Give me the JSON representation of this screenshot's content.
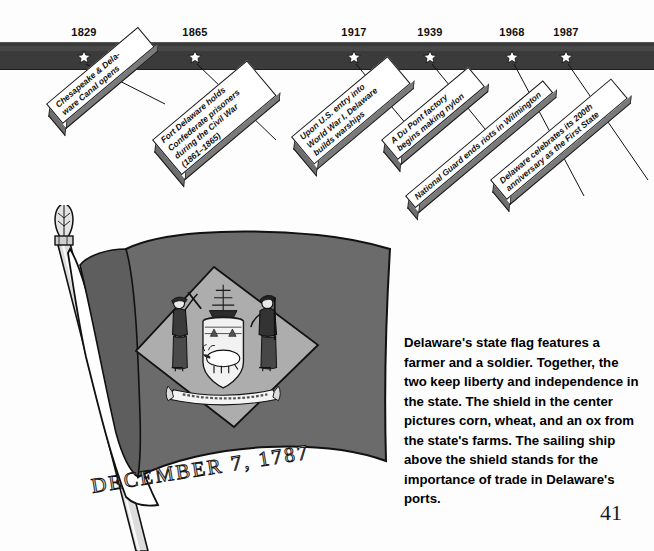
{
  "page": {
    "number": "41",
    "background_color": "#fdfdfd"
  },
  "timeline": {
    "bar_color": "#3b3b3b",
    "star_color": "#ffffff",
    "events": [
      {
        "year": "1829",
        "star_x": 84,
        "label_lines": [
          "Chesapeake & Dela-",
          "ware Canal opens"
        ],
        "plaque_x": 46,
        "plaque_y": 104,
        "plaque_w": 120,
        "plaque_h": 26
      },
      {
        "year": "1865",
        "star_x": 195,
        "label_lines": [
          "Fort Delaware holds",
          "Confederate prisoners",
          "during the Civil War",
          "(1861–1865)"
        ],
        "plaque_x": 152,
        "plaque_y": 140,
        "plaque_w": 124,
        "plaque_h": 46
      },
      {
        "year": "1917",
        "star_x": 354,
        "label_lines": [
          "Upon U.S. entry into",
          "World War I, Delaware",
          "builds warships"
        ],
        "plaque_x": 291,
        "plaque_y": 137,
        "plaque_w": 126,
        "plaque_h": 36
      },
      {
        "year": "1939",
        "star_x": 430,
        "label_lines": [
          "A Du Pont factory",
          "begins making nylon"
        ],
        "plaque_x": 381,
        "plaque_y": 140,
        "plaque_w": 114,
        "plaque_h": 26
      },
      {
        "year": "1968",
        "star_x": 512,
        "label_lines": [
          "National Guard ends riots in Wilmington"
        ],
        "plaque_x": 405,
        "plaque_y": 196,
        "plaque_w": 180,
        "plaque_h": 16
      },
      {
        "year": "1987",
        "star_x": 566,
        "label_lines": [
          "Delaware celebrates its 200th",
          "anniversary as the First State"
        ],
        "plaque_x": 490,
        "plaque_y": 180,
        "plaque_w": 158,
        "plaque_h": 26
      }
    ]
  },
  "flag": {
    "caption_on_flag": "DECEMBER 7, 1787",
    "field_color": "#6b6b6b",
    "diamond_color": "#adadad",
    "pole_color": "#d8d8d8",
    "alt": "Delaware state flag on a pole with the state coat of arms showing a farmer, a soldier, a sailing ship, and an ox"
  },
  "body": {
    "paragraph": "Delaware's state flag features a farmer and a soldier. Together, the two keep liberty and independence in the state. The shield in the center pictures corn, wheat, and an ox from the state's farms. The sailing ship above the shield stands for the importance of trade in Delaware's ports."
  }
}
